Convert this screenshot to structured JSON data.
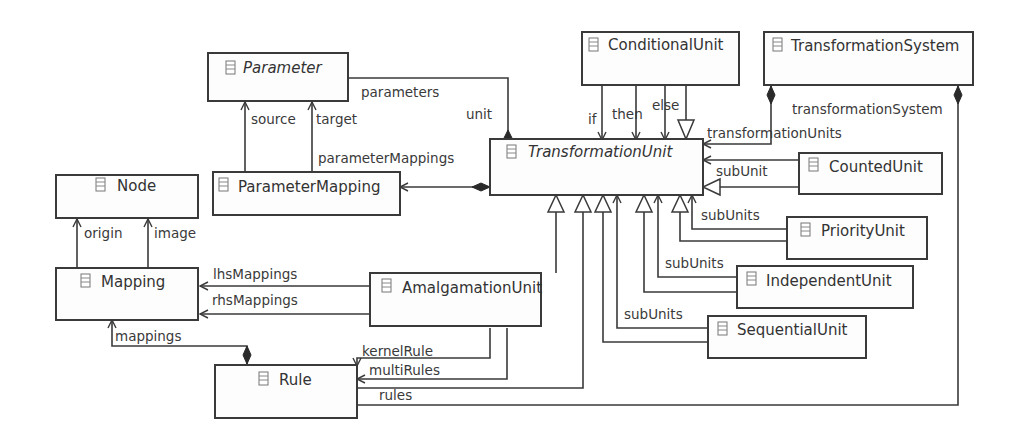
{
  "diagram": {
    "type": "uml-class-diagram",
    "classes": [
      {
        "id": "parameter",
        "name": "Parameter",
        "abstract": true
      },
      {
        "id": "conditional_unit",
        "name": "ConditionalUnit",
        "abstract": false
      },
      {
        "id": "transformation_system",
        "name": "TransformationSystem",
        "abstract": false
      },
      {
        "id": "transformation_unit",
        "name": "TransformationUnit",
        "abstract": true
      },
      {
        "id": "node",
        "name": "Node",
        "abstract": false
      },
      {
        "id": "parameter_mapping",
        "name": "ParameterMapping",
        "abstract": false
      },
      {
        "id": "counted_unit",
        "name": "CountedUnit",
        "abstract": false
      },
      {
        "id": "priority_unit",
        "name": "PriorityUnit",
        "abstract": false
      },
      {
        "id": "mapping",
        "name": "Mapping",
        "abstract": false
      },
      {
        "id": "amalgamation_unit",
        "name": "AmalgamationUnit",
        "abstract": false
      },
      {
        "id": "independent_unit",
        "name": "IndependentUnit",
        "abstract": false
      },
      {
        "id": "sequential_unit",
        "name": "SequentialUnit",
        "abstract": false
      },
      {
        "id": "rule",
        "name": "Rule",
        "abstract": false
      }
    ],
    "roles": {
      "parameters": "parameters",
      "unit": "unit",
      "source": "source",
      "target": "target",
      "parameter_mappings": "parameterMappings",
      "if": "if",
      "then": "then",
      "else": "else",
      "transformation_units": "transformationUnits",
      "transformation_system": "transformationSystem",
      "sub_unit": "subUnit",
      "sub_units_priority": "subUnits",
      "sub_units_independent": "subUnits",
      "sub_units_sequential": "subUnits",
      "origin": "origin",
      "image": "image",
      "lhs_mappings": "lhsMappings",
      "rhs_mappings": "rhsMappings",
      "mappings": "mappings",
      "kernel_rule": "kernelRule",
      "multi_rules": "multiRules",
      "rules": "rules"
    },
    "relationships": [
      {
        "from": "Parameter",
        "to": "TransformationUnit",
        "kind": "composition",
        "roles": [
          "parameters",
          "unit"
        ]
      },
      {
        "from": "ParameterMapping",
        "to": "Parameter",
        "kind": "association",
        "role": "source"
      },
      {
        "from": "ParameterMapping",
        "to": "Parameter",
        "kind": "association",
        "role": "target"
      },
      {
        "from": "TransformationUnit",
        "to": "ParameterMapping",
        "kind": "composition",
        "role": "parameterMappings"
      },
      {
        "from": "ConditionalUnit",
        "to": "TransformationUnit",
        "kind": "association",
        "role": "if"
      },
      {
        "from": "ConditionalUnit",
        "to": "TransformationUnit",
        "kind": "association",
        "role": "then"
      },
      {
        "from": "ConditionalUnit",
        "to": "TransformationUnit",
        "kind": "association",
        "role": "else"
      },
      {
        "from": "ConditionalUnit",
        "to": "TransformationUnit",
        "kind": "generalization"
      },
      {
        "from": "TransformationSystem",
        "to": "TransformationUnit",
        "kind": "composition",
        "role": "transformationUnits"
      },
      {
        "from": "CountedUnit",
        "to": "TransformationUnit",
        "kind": "association",
        "role": "subUnit"
      },
      {
        "from": "CountedUnit",
        "to": "TransformationUnit",
        "kind": "generalization"
      },
      {
        "from": "PriorityUnit",
        "to": "TransformationUnit",
        "kind": "association",
        "role": "subUnits"
      },
      {
        "from": "PriorityUnit",
        "to": "TransformationUnit",
        "kind": "generalization"
      },
      {
        "from": "IndependentUnit",
        "to": "TransformationUnit",
        "kind": "association",
        "role": "subUnits"
      },
      {
        "from": "IndependentUnit",
        "to": "TransformationUnit",
        "kind": "generalization"
      },
      {
        "from": "SequentialUnit",
        "to": "TransformationUnit",
        "kind": "association",
        "role": "subUnits"
      },
      {
        "from": "SequentialUnit",
        "to": "TransformationUnit",
        "kind": "generalization"
      },
      {
        "from": "AmalgamationUnit",
        "to": "TransformationUnit",
        "kind": "generalization"
      },
      {
        "from": "Rule",
        "to": "TransformationUnit",
        "kind": "generalization"
      },
      {
        "from": "Mapping",
        "to": "Node",
        "kind": "association",
        "role": "origin"
      },
      {
        "from": "Mapping",
        "to": "Node",
        "kind": "association",
        "role": "image"
      },
      {
        "from": "AmalgamationUnit",
        "to": "Mapping",
        "kind": "association",
        "role": "lhsMappings"
      },
      {
        "from": "AmalgamationUnit",
        "to": "Mapping",
        "kind": "association",
        "role": "rhsMappings"
      },
      {
        "from": "Rule",
        "to": "Mapping",
        "kind": "composition",
        "role": "mappings"
      },
      {
        "from": "AmalgamationUnit",
        "to": "Rule",
        "kind": "association",
        "role": "kernelRule"
      },
      {
        "from": "AmalgamationUnit",
        "to": "Rule",
        "kind": "association",
        "role": "multiRules"
      },
      {
        "from": "TransformationSystem",
        "to": "Rule",
        "kind": "composition",
        "roles": [
          "rules",
          "transformationSystem"
        ]
      }
    ]
  }
}
